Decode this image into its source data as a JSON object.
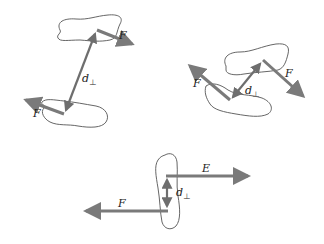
{
  "figures": [
    {
      "name": "diagram-top-left",
      "labels": {
        "force_upper": "F",
        "force_lower": "F",
        "distance": "d",
        "distance_sub": "⊥"
      }
    },
    {
      "name": "diagram-top-right",
      "labels": {
        "force_left": "F",
        "force_right": "F",
        "distance": "d",
        "distance_sub": "⊥"
      }
    },
    {
      "name": "diagram-bottom",
      "labels": {
        "force_right": "E",
        "force_left": "F",
        "distance": "d",
        "distance_sub": "⊥"
      }
    }
  ],
  "colors": {
    "arrow": "#7a7a7a",
    "outline": "#555555",
    "text": "#222222"
  }
}
